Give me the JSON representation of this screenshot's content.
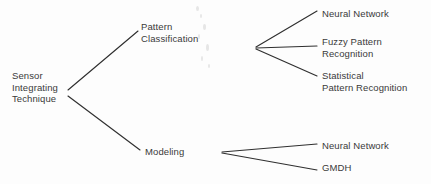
{
  "diagram": {
    "type": "tree",
    "colors": {
      "background": "#fdfdfd",
      "line": "#2f2f2f",
      "text": "#3a3a3a"
    },
    "root": {
      "id": "root",
      "lines": [
        "Sensor",
        "Integrating",
        "Technique"
      ],
      "x": 12,
      "y": 70
    },
    "level1": [
      {
        "id": "pattern-classification",
        "lines": [
          "Pattern",
          "Classification"
        ],
        "x": 141,
        "y": 21
      },
      {
        "id": "modeling",
        "lines": [
          "Modeling"
        ],
        "x": 145,
        "y": 146
      }
    ],
    "level2": [
      {
        "id": "neural-network-pc",
        "parent": "pattern-classification",
        "lines": [
          "Neural Network"
        ],
        "x": 322,
        "y": 8
      },
      {
        "id": "fuzzy-pattern-recognition",
        "parent": "pattern-classification",
        "lines": [
          "Fuzzy Pattern",
          "Recognition"
        ],
        "x": 322,
        "y": 36
      },
      {
        "id": "statistical-pattern-recognition",
        "parent": "pattern-classification",
        "lines": [
          "Statistical",
          "Pattern Recognition"
        ],
        "x": 322,
        "y": 70
      },
      {
        "id": "neural-network-modeling",
        "parent": "modeling",
        "lines": [
          "Neural Network"
        ],
        "x": 322,
        "y": 140
      },
      {
        "id": "gmdh",
        "parent": "modeling",
        "lines": [
          "GMDH"
        ],
        "x": 322,
        "y": 162
      }
    ],
    "edges": [
      {
        "id": "root-to-pattern-classification",
        "x1": 68,
        "y1": 90,
        "x2": 138,
        "y2": 31
      },
      {
        "id": "root-to-modeling",
        "x1": 68,
        "y1": 96,
        "x2": 140,
        "y2": 150
      },
      {
        "id": "pc-to-neural-network",
        "x1": 256,
        "y1": 47,
        "x2": 317,
        "y2": 11
      },
      {
        "id": "pc-to-fuzzy-pattern-recognition",
        "x1": 256,
        "y1": 48,
        "x2": 317,
        "y2": 46
      },
      {
        "id": "pc-to-statistical-pattern-recognition",
        "x1": 256,
        "y1": 49,
        "x2": 317,
        "y2": 76
      },
      {
        "id": "modeling-to-neural-network",
        "x1": 222,
        "y1": 152,
        "x2": 317,
        "y2": 144
      },
      {
        "id": "modeling-to-gmdh",
        "x1": 222,
        "y1": 153,
        "x2": 317,
        "y2": 170
      }
    ]
  }
}
